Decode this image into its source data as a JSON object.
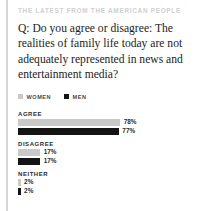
{
  "kicker": "THE LATEST FROM THE AMERICAN PEOPLE",
  "question": "Q: Do you agree or disagree: The realities of family life today are not adequately represented in news and entertainment media?",
  "legend": {
    "items": [
      {
        "label": "WOMEN",
        "swatch": "women-swatch-icon",
        "color": "#c9c9c9"
      },
      {
        "label": "MEN",
        "swatch": "men-swatch-icon",
        "color": "#141414"
      }
    ]
  },
  "chart_data": {
    "type": "bar",
    "orientation": "horizontal",
    "title": "Q: Do you agree or disagree: The realities of family life today are not adequately represented in news and entertainment media?",
    "subtitle": "THE LATEST FROM THE AMERICAN PEOPLE",
    "categories": [
      "AGREE",
      "DISAGREE",
      "NEITHER"
    ],
    "series": [
      {
        "name": "WOMEN",
        "color": "#c9c9c9",
        "values": [
          78,
          17,
          2
        ],
        "labels": [
          "78%",
          "17%",
          "2%"
        ]
      },
      {
        "name": "MEN",
        "color": "#141414",
        "values": [
          77,
          17,
          2
        ],
        "labels": [
          "77%",
          "17%",
          "2%"
        ]
      }
    ],
    "xlabel": "",
    "ylabel": "",
    "xlim": [
      0,
      100
    ],
    "unit": "%",
    "grid": false,
    "legend_position": "top-left",
    "groups": [
      {
        "label": "AGREE",
        "bars": [
          {
            "series": "WOMEN",
            "value": 78,
            "label": "78%"
          },
          {
            "series": "MEN",
            "value": 77,
            "label": "77%"
          }
        ]
      },
      {
        "label": "DISAGREE",
        "bars": [
          {
            "series": "WOMEN",
            "value": 17,
            "label": "17%"
          },
          {
            "series": "MEN",
            "value": 17,
            "label": "17%"
          }
        ]
      },
      {
        "label": "NEITHER",
        "bars": [
          {
            "series": "WOMEN",
            "value": 2,
            "label": "2%"
          },
          {
            "series": "MEN",
            "value": 2,
            "label": "2%"
          }
        ]
      }
    ]
  },
  "colors": {
    "women": "#c9c9c9",
    "men": "#141414",
    "rule": "#d6d6d6",
    "kicker": "#cfcfcf",
    "text": "#1c1c1c"
  }
}
